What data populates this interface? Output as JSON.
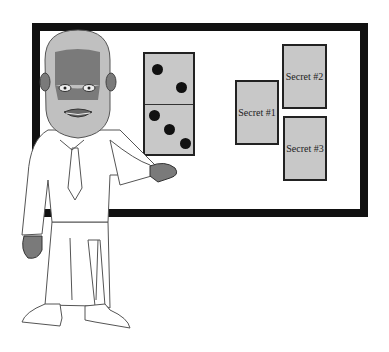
{
  "scene": {
    "description": "Cartoon bearded man presenting a whiteboard",
    "domino": {
      "top_pips": 2,
      "bottom_pips": 3
    },
    "cards": [
      {
        "label": "Secret #1"
      },
      {
        "label": "Secret #2"
      },
      {
        "label": "Secret #3"
      }
    ],
    "colors": {
      "frame": "#111111",
      "card_fill": "#c8c8c8",
      "skin": "#7a7a7a",
      "beard": "#c0c0c0"
    }
  }
}
